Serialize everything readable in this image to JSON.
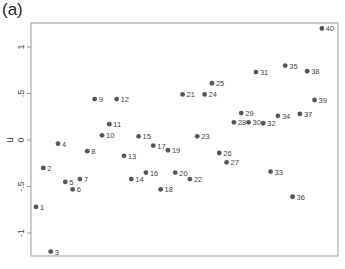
{
  "panel_label": "(a)",
  "chart_data": {
    "type": "scatter",
    "title": "",
    "xlabel": "",
    "ylabel": "u",
    "ylim": [
      -1.25,
      1.25
    ],
    "yticks": [
      1,
      0.5,
      0,
      -0.5,
      -1
    ],
    "ytick_labels": [
      "1",
      ".5",
      "0",
      "-.5",
      "-1"
    ],
    "xticks": [],
    "grid": false,
    "legend": null,
    "marker_color": "#555555",
    "points": [
      {
        "label": "1",
        "x": 1,
        "y": -0.72
      },
      {
        "label": "2",
        "x": 2,
        "y": -0.3
      },
      {
        "label": "3",
        "x": 3,
        "y": -1.2
      },
      {
        "label": "4",
        "x": 4,
        "y": -0.04
      },
      {
        "label": "5",
        "x": 5,
        "y": -0.45
      },
      {
        "label": "6",
        "x": 6,
        "y": -0.53
      },
      {
        "label": "7",
        "x": 7,
        "y": -0.42
      },
      {
        "label": "8",
        "x": 8,
        "y": -0.12
      },
      {
        "label": "9",
        "x": 9,
        "y": 0.44
      },
      {
        "label": "10",
        "x": 10,
        "y": 0.05
      },
      {
        "label": "11",
        "x": 11,
        "y": 0.17
      },
      {
        "label": "12",
        "x": 12,
        "y": 0.44
      },
      {
        "label": "13",
        "x": 13,
        "y": -0.17
      },
      {
        "label": "14",
        "x": 14,
        "y": -0.42
      },
      {
        "label": "15",
        "x": 15,
        "y": 0.04
      },
      {
        "label": "16",
        "x": 16,
        "y": -0.35
      },
      {
        "label": "17",
        "x": 17,
        "y": -0.06
      },
      {
        "label": "18",
        "x": 18,
        "y": -0.53
      },
      {
        "label": "19",
        "x": 19,
        "y": -0.11
      },
      {
        "label": "20",
        "x": 20,
        "y": -0.35
      },
      {
        "label": "21",
        "x": 21,
        "y": 0.49
      },
      {
        "label": "22",
        "x": 22,
        "y": -0.42
      },
      {
        "label": "23",
        "x": 23,
        "y": 0.04
      },
      {
        "label": "24",
        "x": 24,
        "y": 0.49
      },
      {
        "label": "25",
        "x": 25,
        "y": 0.61
      },
      {
        "label": "26",
        "x": 26,
        "y": -0.14
      },
      {
        "label": "27",
        "x": 27,
        "y": -0.24
      },
      {
        "label": "28",
        "x": 28,
        "y": 0.19
      },
      {
        "label": "29",
        "x": 29,
        "y": 0.29
      },
      {
        "label": "30",
        "x": 30,
        "y": 0.19
      },
      {
        "label": "31",
        "x": 31,
        "y": 0.73
      },
      {
        "label": "32",
        "x": 32,
        "y": 0.18
      },
      {
        "label": "33",
        "x": 33,
        "y": -0.34
      },
      {
        "label": "34",
        "x": 34,
        "y": 0.26
      },
      {
        "label": "35",
        "x": 35,
        "y": 0.8
      },
      {
        "label": "36",
        "x": 36,
        "y": -0.61
      },
      {
        "label": "37",
        "x": 37,
        "y": 0.28
      },
      {
        "label": "38",
        "x": 38,
        "y": 0.74
      },
      {
        "label": "39",
        "x": 39,
        "y": 0.43
      },
      {
        "label": "40",
        "x": 40,
        "y": 1.2
      }
    ]
  }
}
